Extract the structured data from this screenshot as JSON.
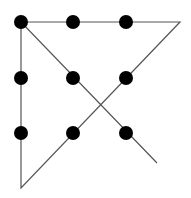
{
  "diagram": {
    "colors": {
      "dot": "#000000",
      "line": "#555555",
      "background": "#ffffff"
    },
    "dot_radius": 7,
    "dots": [
      {
        "x": 21,
        "y": 22
      },
      {
        "x": 73,
        "y": 22
      },
      {
        "x": 126,
        "y": 22
      },
      {
        "x": 21,
        "y": 78
      },
      {
        "x": 73,
        "y": 78
      },
      {
        "x": 126,
        "y": 78
      },
      {
        "x": 21,
        "y": 133
      },
      {
        "x": 73,
        "y": 133
      },
      {
        "x": 126,
        "y": 133
      }
    ],
    "path": [
      {
        "x": 21,
        "y": 22
      },
      {
        "x": 180,
        "y": 22
      },
      {
        "x": 21,
        "y": 188
      },
      {
        "x": 21,
        "y": 22
      },
      {
        "x": 157,
        "y": 163
      }
    ]
  }
}
